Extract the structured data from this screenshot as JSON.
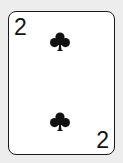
{
  "card": {
    "rank": "2",
    "suit": "clubs",
    "suit_icon": "club-icon",
    "corner_top_left": "2",
    "corner_bottom_right": "2",
    "pip_count": 2,
    "colors": {
      "ink": "#111111",
      "card_face": "#ffffff",
      "border": "#1a1a1a",
      "background": "#ededed"
    }
  }
}
